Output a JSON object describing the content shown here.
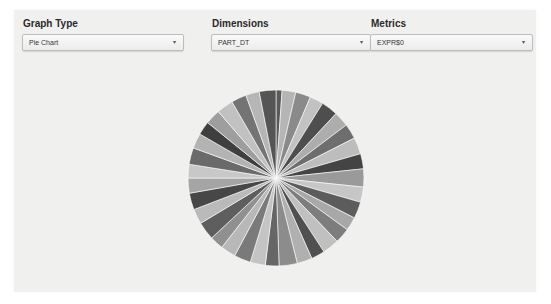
{
  "controls": {
    "graph_type": {
      "label": "Graph Type",
      "value": "Pie Chart",
      "icon": "chevron-down-icon"
    },
    "dimensions": {
      "label": "Dimensions",
      "value": "PART_DT",
      "icon": "chevron-down-icon"
    },
    "metrics": {
      "label": "Metrics",
      "value": "EXPR$0",
      "icon": "chevron-down-icon"
    }
  },
  "arrow_glyph": "▾",
  "chart_data": {
    "type": "pie",
    "title": "",
    "dimension": "PART_DT",
    "metric": "EXPR$0",
    "legend": "none",
    "labels": "none",
    "slice_count": 36,
    "start_angle_deg": 0,
    "direction": "clockwise",
    "values": [
      4,
      9,
      10,
      9,
      11,
      10,
      10,
      11,
      10,
      12,
      10,
      11,
      9,
      10,
      11,
      9,
      10,
      12,
      9,
      10,
      11,
      10,
      9,
      12,
      10,
      11,
      10,
      9,
      11,
      10,
      9,
      10,
      11,
      10,
      9,
      11
    ],
    "colors": [
      "#5a5a5a",
      "#b5b5b5",
      "#8a8a8a",
      "#c2c2c2",
      "#4e4e4e",
      "#adadad",
      "#6e6e6e",
      "#bdbdbd",
      "#444444",
      "#9a9a9a",
      "#c6c6c6",
      "#5c5c5c",
      "#a8a8a8",
      "#7d7d7d",
      "#c0c0c0",
      "#505050",
      "#b0b0b0",
      "#8c8c8c",
      "#666666",
      "#c4c4c4",
      "#7a7a7a",
      "#b8b8b8",
      "#909090",
      "#5e5e5e",
      "#bababa",
      "#474747",
      "#a5a5a5",
      "#c8c8c8",
      "#6a6a6a",
      "#b3b3b3",
      "#3f3f3f",
      "#9e9e9e",
      "#c1c1c1",
      "#747474",
      "#b6b6b6",
      "#555555"
    ]
  }
}
